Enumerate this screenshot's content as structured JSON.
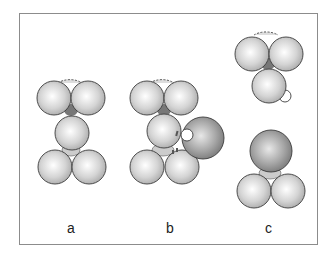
{
  "figure": {
    "panels": [
      {
        "id": "a",
        "label": "a"
      },
      {
        "id": "b",
        "label": "b"
      },
      {
        "id": "c",
        "label": "c"
      }
    ],
    "colors": {
      "sphere_light": "#e6e6e6",
      "sphere_dark": "#9a9a9a",
      "outline": "#3c3c3c",
      "frame": "#8c8c8c",
      "small_sphere": "#ffffff"
    }
  }
}
